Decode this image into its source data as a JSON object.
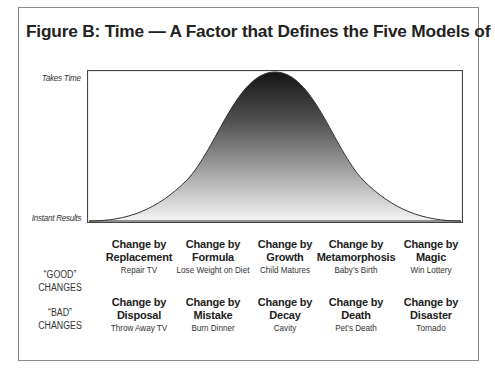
{
  "figure": {
    "title": "Figure B: Time — A Factor that Defines the Five Models of Change",
    "y_axis": {
      "top_label": "Takes Time",
      "bottom_label": "Instant Results"
    },
    "colors": {
      "frame": "#8a8a8a",
      "curve_top": "#1a1a1a",
      "curve_bottom": "#f5f5f5",
      "text": "#222222"
    }
  },
  "rows": [
    {
      "label_line1": "“GOOD”",
      "label_line2": "CHANGES",
      "items": [
        {
          "title_line1": "Change by",
          "title_line2": "Replacement",
          "example": "Repair TV"
        },
        {
          "title_line1": "Change by",
          "title_line2": "Formula",
          "example": "Lose Weight on Diet"
        },
        {
          "title_line1": "Change by",
          "title_line2": "Growth",
          "example": "Child Matures"
        },
        {
          "title_line1": "Change by",
          "title_line2": "Metamorphosis",
          "example": "Baby’s Birth"
        },
        {
          "title_line1": "Change by",
          "title_line2": "Magic",
          "example": "Win Lottery"
        }
      ]
    },
    {
      "label_line1": "“BAD”",
      "label_line2": "CHANGES",
      "items": [
        {
          "title_line1": "Change by",
          "title_line2": "Disposal",
          "example": "Throw Away TV"
        },
        {
          "title_line1": "Change by",
          "title_line2": "Mistake",
          "example": "Burn Dinner"
        },
        {
          "title_line1": "Change by",
          "title_line2": "Decay",
          "example": "Cavity"
        },
        {
          "title_line1": "Change by",
          "title_line2": "Death",
          "example": "Pet’s Death"
        },
        {
          "title_line1": "Change by",
          "title_line2": "Disaster",
          "example": "Tornado"
        }
      ]
    }
  ]
}
